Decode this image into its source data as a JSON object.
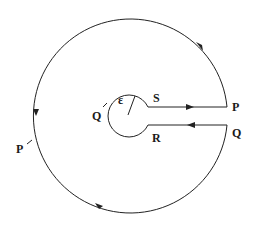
{
  "diagram": {
    "type": "keyhole contour",
    "labels": {
      "S": "S",
      "R": "R",
      "P_right": "P",
      "Q_right": "Q",
      "Q_left": "Q",
      "P_left": "P",
      "epsilon": "ε"
    },
    "elements": [
      {
        "name": "large-arc",
        "description": "large circle traversed counterclockwise from P (right) to Q (right)"
      },
      {
        "name": "small-circle",
        "description": "small circle of radius ε around origin, traversed clockwise from S to R"
      },
      {
        "name": "segment-S-P",
        "description": "line from small circle at S to P, arrow pointing right"
      },
      {
        "name": "segment-Q-R",
        "description": "line from Q to small circle at R, arrow pointing left"
      }
    ],
    "colors": {
      "stroke": "#222222",
      "background": "#ffffff"
    }
  }
}
